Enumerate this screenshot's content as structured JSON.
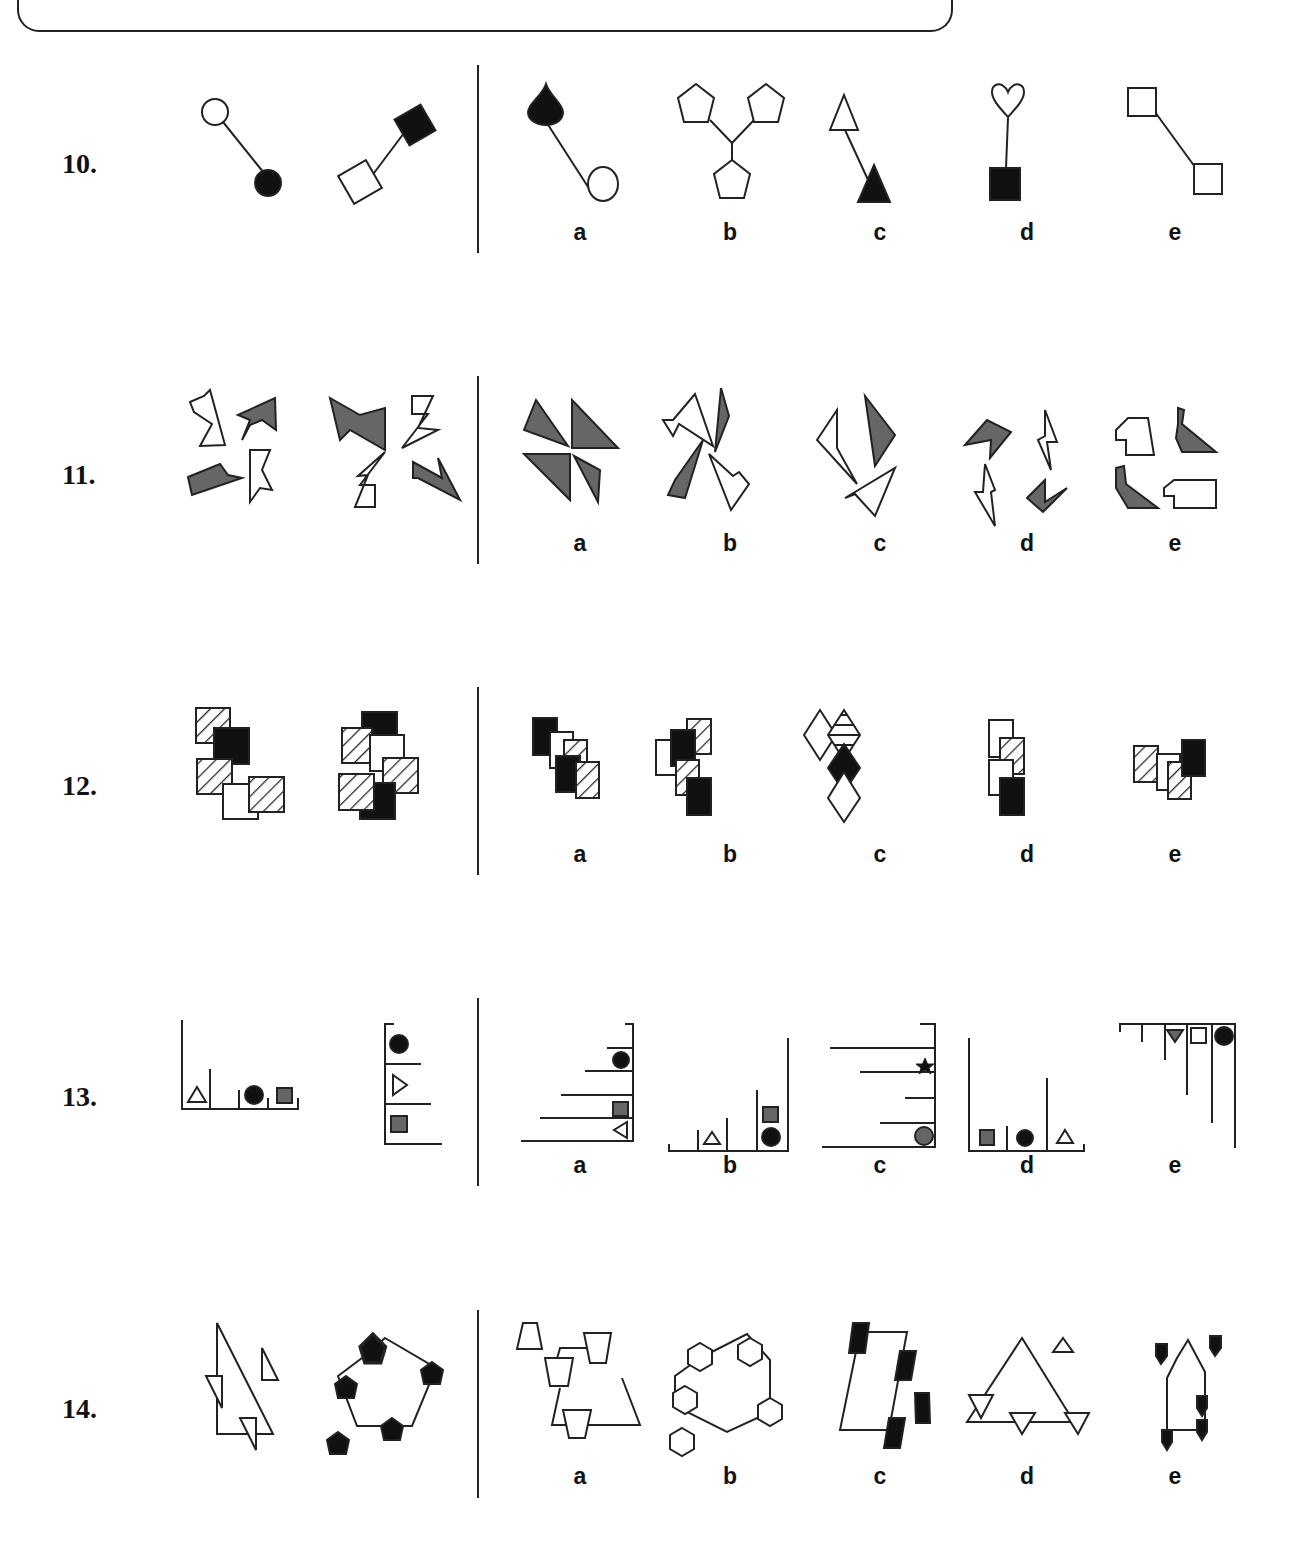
{
  "header": {
    "frame": "top-rounded-box"
  },
  "questions": [
    {
      "number": "10.",
      "options": [
        "a",
        "b",
        "c",
        "d",
        "e"
      ],
      "question_figures": [
        "circle-open linked to circle-filled",
        "square-open linked to square-filled"
      ],
      "answer_figures": [
        "teardrop-filled linked to circle-open",
        "three pentagons joined in Y",
        "triangle-open linked to triangle-filled",
        "heart-open linked to square-filled",
        "square-open linked to square-open"
      ]
    },
    {
      "number": "11.",
      "options": [
        "a",
        "b",
        "c",
        "d",
        "e"
      ],
      "question_figures": [
        "four pinwheel polygons (two grey, two white)",
        "four lightning-bolt shapes (two grey, two white)"
      ],
      "answer_figures": [
        "four grey triangles pinwheel",
        "two white two grey sharp shapes",
        "three chevrons",
        "four zig-zag shapes",
        "four step shapes"
      ]
    },
    {
      "number": "12.",
      "options": [
        "a",
        "b",
        "c",
        "d",
        "e"
      ],
      "question_figures": [
        "five overlapping squares",
        "six overlapping squares"
      ],
      "answer_figures": [
        "five overlapping rectangles",
        "six overlapping rectangles",
        "four overlapping diamonds",
        "four overlapping rectangles",
        "four overlapping rectangles"
      ]
    },
    {
      "number": "13.",
      "options": [
        "a",
        "b",
        "c",
        "d",
        "e"
      ],
      "question_figures": [
        "floor shelf with triangle, circle, grey square",
        "wall shelf with circle, triangle, grey square"
      ],
      "answer_figures": [
        "right wall shelves with circle, grey square, triangle",
        "floor shelves with triangle, grey square, circle",
        "right wall shelves with star and grey circle",
        "floor shelves with grey square, circle, triangle",
        "ceiling shelves with grey triangle, square, circle"
      ]
    },
    {
      "number": "14.",
      "options": [
        "a",
        "b",
        "c",
        "d",
        "e"
      ],
      "question_figures": [
        "triangle with small triangles",
        "pentagon with black pentagons"
      ],
      "answer_figures": [
        "trapezoid loop with trapezoids",
        "hexagon loop with hexagons",
        "parallelogram with black rectangles",
        "triangle with triangles",
        "house outline with black tags"
      ]
    }
  ]
}
